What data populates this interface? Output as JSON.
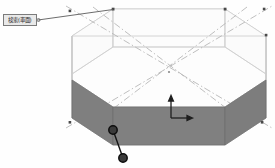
{
  "viewport": {
    "name": "3d-model-viewport",
    "background_color": "#fefefe"
  },
  "callout": {
    "label": "検索(車面)",
    "box_fill": "#e9e9e9",
    "box_border": "#7b7b7b",
    "leader_color": "#5b5b5b"
  },
  "model": {
    "name": "octagonal-prism",
    "edge_color": "#c8c8c8",
    "top_face_fill": "#fcfcfc",
    "inner_wall_fill": "#fafafa",
    "highlight_fill": "#808080",
    "highlight_edge": "#6a6a6a",
    "construction_line_color": "#b0b0b0",
    "vertex_marker_color": "#4a4a4a",
    "handle_color": "#1a1a1a",
    "top_ring_radius_x": 118,
    "top_ring_radius_y": 46,
    "bottom_ring_radius_x": 118,
    "bottom_ring_radius_y": 46,
    "sides": 8,
    "wall_height_px": 52
  },
  "axis_indicator": {
    "name": "axis-triad",
    "x_label": "",
    "y_label": "",
    "color": "#202020",
    "origin_x": 171,
    "origin_y": 118
  },
  "handles": [
    {
      "name": "drag-handle-upper",
      "cx": 113,
      "cy": 130,
      "r": 4.2
    },
    {
      "name": "drag-handle-lower",
      "cx": 123,
      "cy": 158,
      "r": 4.2
    }
  ],
  "vertex_markers": [
    {
      "x": 70,
      "y": 11
    },
    {
      "x": 113,
      "y": 9
    },
    {
      "x": 225,
      "y": 9
    },
    {
      "x": 264,
      "y": 9
    },
    {
      "x": 266,
      "y": 35
    },
    {
      "x": 70,
      "y": 122
    },
    {
      "x": 262,
      "y": 122
    }
  ]
}
